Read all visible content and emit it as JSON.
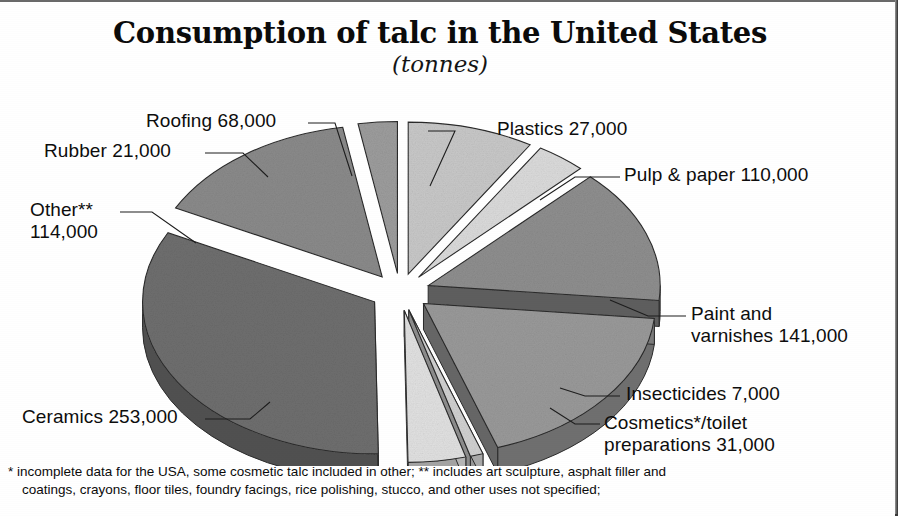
{
  "title": {
    "main": "Consumption of talc in the United States",
    "sub": "(tonnes)"
  },
  "footnote": {
    "line1": "* incomplete data for the USA, some cosmetic talc included in other; ** includes art sculpture, asphalt filler and",
    "line2": "coatings, crayons, floor tiles, foundry facings, rice polishing, stucco, and other uses not specified;"
  },
  "labels": {
    "roofing": "Roofing 68,000",
    "rubber": "Rubber 21,000",
    "other": "Other**\n114,000",
    "ceramics": "Ceramics 253,000",
    "plastics": "Plastics 27,000",
    "pulp": "Pulp & paper 110,000",
    "paint": "Paint and\nvarnishes 141,000",
    "insecticides": "Insecticides 7,000",
    "cosmetics": "Cosmetics*/toilet\npreparations 31,000"
  },
  "chart_data": {
    "type": "pie",
    "title": "Consumption of talc in the United States",
    "subtitle": "(tonnes)",
    "unit": "tonnes",
    "exploded": true,
    "three_d": true,
    "total": 772000,
    "categories": [
      "Ceramics",
      "Paint and varnishes",
      "Other**",
      "Pulp & paper",
      "Roofing",
      "Cosmetics*/toilet preparations",
      "Plastics",
      "Rubber",
      "Insecticides"
    ],
    "values": [
      253000,
      141000,
      114000,
      110000,
      68000,
      31000,
      27000,
      21000,
      7000
    ],
    "slices": [
      {
        "name": "Ceramics",
        "label": "Ceramics 253,000",
        "value": 253000,
        "percent": 32.8,
        "color": "#6f6f6f"
      },
      {
        "name": "Paint and varnishes",
        "label": "Paint and varnishes 141,000",
        "value": 141000,
        "percent": 18.3,
        "color": "#9a9a9a"
      },
      {
        "name": "Other**",
        "label": "Other** 114,000",
        "value": 114000,
        "percent": 14.8,
        "color": "#8b8b8b"
      },
      {
        "name": "Pulp & paper",
        "label": "Pulp & paper 110,000",
        "value": 110000,
        "percent": 14.2,
        "color": "#8f8f8f"
      },
      {
        "name": "Roofing",
        "label": "Roofing 68,000",
        "value": 68000,
        "percent": 8.8,
        "color": "#c9c9c9"
      },
      {
        "name": "Cosmetics*/toilet preparations",
        "label": "Cosmetics*/toilet preparations 31,000",
        "value": 31000,
        "percent": 4.0,
        "color": "#e2e2e2"
      },
      {
        "name": "Plastics",
        "label": "Plastics 27,000",
        "value": 27000,
        "percent": 3.5,
        "color": "#dcdcdc"
      },
      {
        "name": "Rubber",
        "label": "Rubber 21,000",
        "value": 21000,
        "percent": 2.7,
        "color": "#9d9d9d"
      },
      {
        "name": "Insecticides",
        "label": "Insecticides 7,000",
        "value": 7000,
        "percent": 0.9,
        "color": "#d2d2d2"
      }
    ],
    "legend": "none",
    "notes": [
      "* incomplete data for the USA, some cosmetic talc included in other",
      "** includes art sculpture, asphalt filler and coatings, crayons, floor tiles, foundry facings, rice polishing, stucco, and other uses not specified"
    ]
  },
  "colors": {
    "background": "#ffffff",
    "text": "#0d0d0d",
    "outline": "#2b2b2b",
    "frame": "#3a3a3a"
  }
}
